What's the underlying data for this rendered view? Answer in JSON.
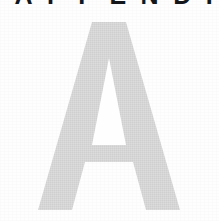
{
  "page": {
    "kind": "book-appendix-divider",
    "background_color": "#fefefe",
    "width": 219,
    "height": 221
  },
  "running_head": {
    "text": "APPENDIX",
    "letters": [
      "A",
      "P",
      "P",
      "E",
      "N",
      "D",
      "I",
      "X"
    ],
    "color": "#15161a",
    "note": "clipped by top page edge; only the bottom few pixels of each capital are visible"
  },
  "drop_letter": {
    "character": "A",
    "color": "#d6d6d6",
    "texture": "dithered halftone scan",
    "bounds": {
      "left": 38,
      "top": 22,
      "right": 180,
      "bottom": 210
    }
  }
}
